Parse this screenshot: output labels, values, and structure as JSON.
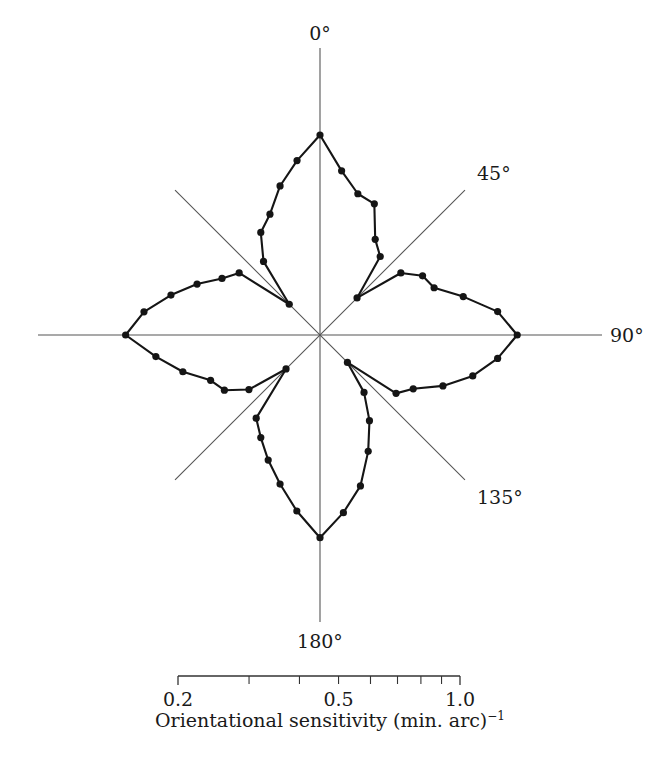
{
  "figure": {
    "kind": "polar-rose-plot",
    "background": "#ffffff",
    "ink_color": "#151515",
    "axis_color": "#555555"
  },
  "angle_labels": {
    "deg0": "0°",
    "deg45": "45°",
    "deg90": "90°",
    "deg135": "135°",
    "deg180": "180°"
  },
  "scalebar": {
    "tick_labels": [
      "0.2",
      "0.5",
      "1.0"
    ],
    "caption_main": "Orientational sensitivity (min. arc)",
    "caption_exponent": "−1",
    "scale_type": "logarithmic",
    "range": [
      0.2,
      1.0
    ],
    "minor_ticks": [
      0.3,
      0.4,
      0.5,
      0.6,
      0.7,
      0.8,
      0.9
    ]
  },
  "chart_data": {
    "type": "line",
    "title": "",
    "xlabel": "Orientational sensitivity (min. arc)^-1",
    "ylabel": "",
    "coordinate_system": "polar",
    "angle_units": "degrees",
    "angle_zero_at": "top",
    "angle_direction": "clockwise",
    "radial_scale": "log",
    "radial_range": [
      0.2,
      1.0
    ],
    "grid": false,
    "legend": null,
    "marker": "filled-circle",
    "closed_path": true,
    "series": [
      {
        "name": "Orientational sensitivity",
        "angles": [
          0,
          7.5,
          15,
          22.5,
          30,
          37.5,
          45,
          52.5,
          60,
          67.5,
          75,
          82.5,
          90,
          97.5,
          105,
          112.5,
          120,
          127.5,
          135,
          142.5,
          150,
          157.5,
          165,
          172.5,
          180,
          187.5,
          195,
          202.5,
          210,
          217.5,
          225,
          232.5,
          240,
          247.5,
          255,
          262.5,
          270,
          277.5,
          285,
          292.5,
          300,
          307.5,
          315,
          322.5,
          330,
          337.5,
          345,
          352.5
        ],
        "values": [
          0.94,
          0.72,
          0.62,
          0.6,
          0.47,
          0.43,
          0.3,
          0.44,
          0.5,
          0.52,
          0.63,
          0.8,
          0.92,
          0.8,
          0.68,
          0.56,
          0.46,
          0.42,
          0.27,
          0.35,
          0.43,
          0.53,
          0.67,
          0.8,
          0.96,
          0.79,
          0.66,
          0.57,
          0.5,
          0.45,
          0.29,
          0.4,
          0.47,
          0.5,
          0.6,
          0.72,
          0.9,
          0.79,
          0.66,
          0.56,
          0.48,
          0.44,
          0.28,
          0.41,
          0.5,
          0.55,
          0.66,
          0.78
        ]
      }
    ]
  }
}
